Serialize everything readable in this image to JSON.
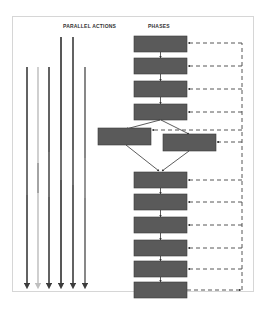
{
  "diagram": {
    "headers": {
      "parallel_actions": "PARALLEL ACTIONS",
      "phases": "PHASES"
    },
    "colors": {
      "box_fill": "#5a5a5a",
      "box_border": "#3a3a3a",
      "arrow_dark": "#3c3c3c",
      "arrow_light": "#bfbfbf",
      "dashed_line": "#444444",
      "frame_border": "#d6d6d6"
    },
    "phases": [
      {
        "id": "phase-1",
        "label": ""
      },
      {
        "id": "phase-2",
        "label": ""
      },
      {
        "id": "phase-3",
        "label": ""
      },
      {
        "id": "phase-4",
        "label": ""
      },
      {
        "id": "phase-5a",
        "label": ""
      },
      {
        "id": "phase-5b",
        "label": ""
      },
      {
        "id": "phase-6",
        "label": ""
      },
      {
        "id": "phase-7",
        "label": ""
      },
      {
        "id": "phase-8",
        "label": ""
      },
      {
        "id": "phase-9",
        "label": ""
      },
      {
        "id": "phase-10",
        "label": ""
      },
      {
        "id": "phase-11",
        "label": ""
      }
    ],
    "parallel_actions": [
      {
        "id": "action-1",
        "label": "",
        "shade": "dark"
      },
      {
        "id": "action-2",
        "label": "",
        "shade": "light"
      },
      {
        "id": "action-3",
        "label": "",
        "shade": "dark"
      },
      {
        "id": "action-4",
        "label": "",
        "shade": "dark"
      },
      {
        "id": "action-5",
        "label": "",
        "shade": "dark"
      },
      {
        "id": "action-6",
        "label": "",
        "shade": "mid"
      }
    ],
    "feedback_loop": {
      "style": "dashed",
      "direction": "from last phase back to all phases"
    }
  }
}
